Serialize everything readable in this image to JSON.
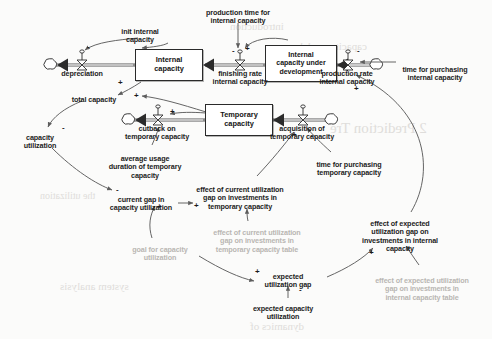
{
  "diagram": {
    "type": "system-dynamics-stock-flow",
    "colors": {
      "ink": "#1b1b1b",
      "stock_border": "#2a2a2a",
      "flow_pipe": "#8a8a8a",
      "link_arc": "#6f6f6f",
      "grayed_text": "#b9b6b2",
      "background": "#fbfbfa"
    },
    "stocks": [
      {
        "id": "internal_capacity",
        "label": "Internal\ncapacity",
        "x": 135,
        "y": 49,
        "w": 68,
        "h": 32
      },
      {
        "id": "internal_capacity_under_development",
        "label": "Internal\ncapacity under\ndevelopment",
        "x": 265,
        "y": 45,
        "w": 72,
        "h": 37
      },
      {
        "id": "temporary_capacity",
        "label": "Temporary\ncapacity",
        "x": 205,
        "y": 104,
        "w": 68,
        "h": 32
      }
    ],
    "flows": [
      {
        "id": "depreciation",
        "label": "depreciation",
        "valve_x": 82,
        "valve_y": 65,
        "cloud_x": 47,
        "cloud_y": 65,
        "label_x": 82,
        "label_y": 70,
        "direction": "outflow-left"
      },
      {
        "id": "finishing_rate_internal_capacity",
        "label": "finishing rate\ninternal capacity",
        "valve_x": 240,
        "valve_y": 65,
        "label_x": 240,
        "label_y": 70,
        "direction": "right-to-left"
      },
      {
        "id": "production_rate_internal_capacity",
        "label": "production rate\ninternal capacity",
        "valve_x": 348,
        "valve_y": 65,
        "cloud_x": 378,
        "cloud_y": 65,
        "label_x": 347,
        "label_y": 70,
        "direction": "right-to-left"
      },
      {
        "id": "cutback_on_temporary_capacity",
        "label": "cutback on\ntemporary capacity",
        "valve_x": 158,
        "valve_y": 120,
        "cloud_x": 125,
        "cloud_y": 120,
        "label_x": 157,
        "label_y": 125,
        "direction": "outflow-left"
      },
      {
        "id": "acquisition_of_temporary_capacity",
        "label": "acquisition of\ntemporary capacity",
        "valve_x": 303,
        "valve_y": 120,
        "cloud_x": 333,
        "cloud_y": 120,
        "label_x": 302,
        "label_y": 125,
        "direction": "right-to-left"
      }
    ],
    "variables": [
      {
        "id": "init_internal_capacity",
        "label": "init internal\ncapacity",
        "x": 140,
        "y": 28,
        "style": "bold"
      },
      {
        "id": "production_time_for_internal_capacity",
        "label": "production time for\ninternal capacity",
        "x": 238,
        "y": 9,
        "style": "bold"
      },
      {
        "id": "time_for_purchasing_internal_capacity",
        "label": "time for purchasing\ninternal capacity",
        "x": 435,
        "y": 66,
        "style": "bold"
      },
      {
        "id": "total_capacity",
        "label": "total capacity",
        "x": 94,
        "y": 96,
        "style": "bold"
      },
      {
        "id": "capacity_utilization",
        "label": "capacity\nutilization",
        "x": 40,
        "y": 134,
        "style": "bold"
      },
      {
        "id": "average_usage_duration_of_temporary_capacity",
        "label": "average usage\nduration of temporary\ncapacity",
        "x": 145,
        "y": 155,
        "style": "bold"
      },
      {
        "id": "current_gap_in_capacity_utilization",
        "label": "current gap in\ncapacity utilization",
        "x": 141,
        "y": 196,
        "style": "bold"
      },
      {
        "id": "effect_of_current_utilization_gap_on_investments_in_temporary_capacity",
        "label": "effect of current utilization\ngap on investments in\ntemporary capacity",
        "x": 240,
        "y": 186,
        "style": "bold"
      },
      {
        "id": "time_for_purchasing_temporary_capacity",
        "label": "time for purchasing\ntemporary capacity",
        "x": 349,
        "y": 161,
        "style": "bold"
      },
      {
        "id": "effect_of_expected_utilization_gap_on_investments_in_internal_capacity",
        "label": "effect of expected\nutilization gap on\ninvestments in internal\ncapacity",
        "x": 400,
        "y": 220,
        "style": "bold"
      },
      {
        "id": "goal_for_capacity_utilization",
        "label": "goal for capacity\nutilization",
        "x": 160,
        "y": 246,
        "style": "gray"
      },
      {
        "id": "effect_of_current_utilization_gap_on_investments_in_temporary_capacity_table",
        "label": "effect of current utilization\ngap on investments in\ntemporary capacity table",
        "x": 257,
        "y": 229,
        "style": "gray"
      },
      {
        "id": "expected_utilization_gap",
        "label": "expected\nutilization gap",
        "x": 287,
        "y": 273,
        "style": "bold"
      },
      {
        "id": "expected_capacity_utilization",
        "label": "expected capacity\nutilization",
        "x": 283,
        "y": 305,
        "style": "bold"
      },
      {
        "id": "effect_of_expected_utilization_gap_on_investments_in_internal_capacity_table",
        "label": "effect of expected utilization\ngap on investments in\ninternal capacity table",
        "x": 422,
        "y": 277,
        "style": "gray"
      }
    ],
    "polarity_marks": [
      {
        "sign": "-",
        "x": 87,
        "y": 47
      },
      {
        "sign": "+",
        "x": 118,
        "y": 83
      },
      {
        "sign": "+",
        "x": 134,
        "y": 96
      },
      {
        "sign": "-",
        "x": 62,
        "y": 128
      },
      {
        "sign": "-",
        "x": 234,
        "y": 52
      },
      {
        "sign": "+",
        "x": 246,
        "y": 50
      },
      {
        "sign": "-",
        "x": 359,
        "y": 52
      },
      {
        "sign": "+",
        "x": 356,
        "y": 89
      },
      {
        "sign": "+",
        "x": 170,
        "y": 112
      },
      {
        "sign": "+",
        "x": 294,
        "y": 135
      },
      {
        "sign": "-",
        "x": 311,
        "y": 136
      },
      {
        "sign": "-",
        "x": 116,
        "y": 190
      },
      {
        "sign": "+",
        "x": 157,
        "y": 207
      },
      {
        "sign": "+",
        "x": 196,
        "y": 205
      },
      {
        "sign": "+",
        "x": 257,
        "y": 290
      },
      {
        "sign": "-",
        "x": 300,
        "y": 290
      },
      {
        "sign": "+",
        "x": 371,
        "y": 253
      }
    ],
    "background_bleed": [
      {
        "text": "2 Prediction Tre",
        "x": 330,
        "y": 120,
        "size": 15
      },
      {
        "text": "introduction",
        "x": 230,
        "y": 20,
        "size": 11
      },
      {
        "text": "capacity model",
        "x": 300,
        "y": 40,
        "size": 11
      },
      {
        "text": "the utilization",
        "x": 40,
        "y": 190,
        "size": 10
      },
      {
        "text": "system analysis",
        "x": 60,
        "y": 280,
        "size": 11
      },
      {
        "text": "dynamics of",
        "x": 250,
        "y": 320,
        "size": 11
      }
    ]
  }
}
